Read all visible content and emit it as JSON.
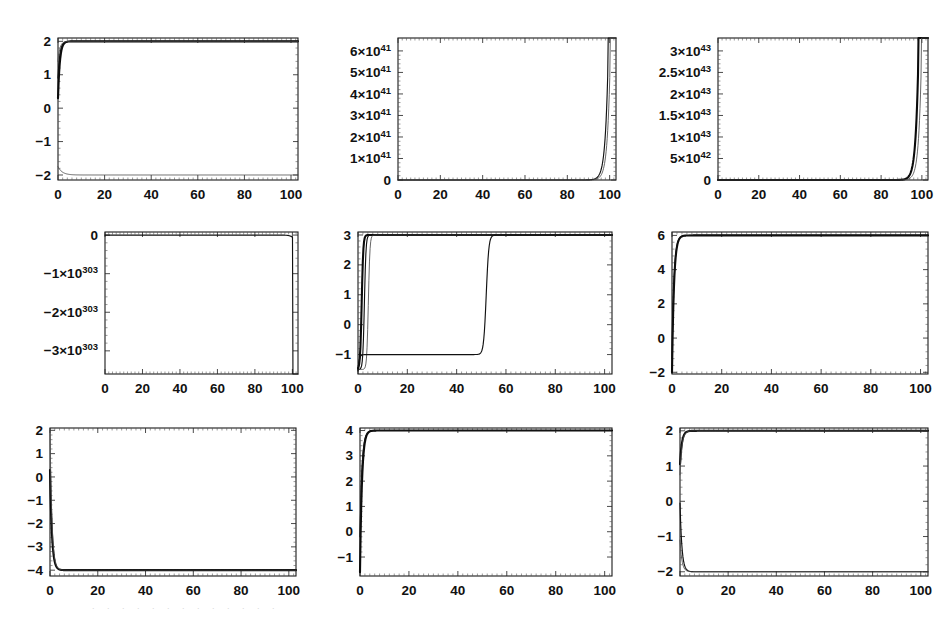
{
  "figure": {
    "title": "",
    "rows": 3,
    "columns": 3,
    "background_color": "#ffffff",
    "curve_color": "#111111",
    "frame_color": "#1a1a1a"
  },
  "chart_data": [
    {
      "id": "panel-1",
      "type": "line",
      "title": "",
      "xlabel": "",
      "ylabel": "",
      "xlim": [
        0,
        103
      ],
      "ylim": [
        -2.15,
        2.1
      ],
      "grid": false,
      "legend": null,
      "xticks": [
        0,
        20,
        40,
        60,
        80,
        100
      ],
      "xtick_labels": [
        "0",
        "20",
        "40",
        "60",
        "80",
        "100"
      ],
      "yticks": [
        -2,
        -1,
        0,
        1,
        2
      ],
      "ytick_labels": [
        "-2",
        "-1",
        "0",
        "1",
        "2"
      ],
      "series": [
        {
          "name": "upper-bundle",
          "asymptote": 2,
          "start": 0.3,
          "rise": "fast",
          "style": "thick"
        },
        {
          "name": "upper-bundle-2",
          "asymptote": 2,
          "start": 0.9,
          "rise": "fast",
          "style": "normal"
        },
        {
          "name": "upper-bundle-3",
          "asymptote": 2,
          "start": 1.4,
          "rise": "fast",
          "style": "light"
        },
        {
          "name": "lower-branch",
          "asymptote": -2,
          "start": -1.75,
          "rise": "slow",
          "style": "light"
        }
      ]
    },
    {
      "id": "panel-2",
      "type": "line",
      "title": "",
      "xlabel": "",
      "ylabel": "",
      "xlim": [
        0,
        103
      ],
      "ylim": [
        0,
        6.6
      ],
      "grid": false,
      "legend": null,
      "xticks": [
        0,
        20,
        40,
        60,
        80,
        100
      ],
      "xtick_labels": [
        "0",
        "20",
        "40",
        "60",
        "80",
        "100"
      ],
      "yticks": [
        0,
        1,
        2,
        3,
        4,
        5,
        6
      ],
      "ytick_labels": [
        "0",
        "1×10^41",
        "2×10^41",
        "3×10^41",
        "4×10^41",
        "5×10^41",
        "6×10^41"
      ],
      "ytick_mantissas": [
        "0",
        "1",
        "2",
        "3",
        "4",
        "5",
        "6"
      ],
      "ytick_exponents": [
        "",
        "41",
        "41",
        "41",
        "41",
        "41",
        "41"
      ],
      "series": [
        {
          "name": "blowup",
          "blowup_x": 99.5,
          "style": "normal"
        },
        {
          "name": "blowup-2",
          "blowup_x": 100.5,
          "style": "light"
        }
      ]
    },
    {
      "id": "panel-3",
      "type": "line",
      "title": "",
      "xlabel": "",
      "ylabel": "",
      "xlim": [
        0,
        103
      ],
      "ylim": [
        0,
        3.3
      ],
      "grid": false,
      "legend": null,
      "xticks": [
        0,
        20,
        40,
        60,
        80,
        100
      ],
      "xtick_labels": [
        "0",
        "20",
        "40",
        "60",
        "80",
        "100"
      ],
      "yticks": [
        0,
        0.5,
        1,
        1.5,
        2,
        2.5,
        3
      ],
      "ytick_labels": [
        "0",
        "5×10^42",
        "1×10^43",
        "1.5×10^43",
        "2×10^43",
        "2.5×10^43",
        "3×10^43"
      ],
      "ytick_mantissas": [
        "0",
        "5",
        "1",
        "1.5",
        "2",
        "2.5",
        "3"
      ],
      "ytick_exponents": [
        "",
        "42",
        "43",
        "43",
        "43",
        "43",
        "43"
      ],
      "series": [
        {
          "name": "blowup",
          "blowup_x": 98.5,
          "style": "thick"
        },
        {
          "name": "blowup-2",
          "blowup_x": 100.0,
          "style": "light"
        }
      ]
    },
    {
      "id": "panel-4",
      "type": "line",
      "title": "",
      "xlabel": "",
      "ylabel": "",
      "xlim": [
        0,
        103
      ],
      "ylim": [
        -3.6,
        0.08
      ],
      "grid": false,
      "legend": null,
      "xticks": [
        0,
        20,
        40,
        60,
        80,
        100
      ],
      "xtick_labels": [
        "0",
        "20",
        "40",
        "60",
        "80",
        "100"
      ],
      "yticks": [
        0,
        -1,
        -2,
        -3
      ],
      "ytick_labels": [
        "0",
        "-1×10^303",
        "-2×10^303",
        "-3×10^303"
      ],
      "ytick_mantissas": [
        "0",
        "−1",
        "−2",
        "−3"
      ],
      "ytick_exponents": [
        "",
        "303",
        "303",
        "303"
      ],
      "series": [
        {
          "name": "negative-blowup",
          "blowup_x": 100.5,
          "style": "normal"
        }
      ]
    },
    {
      "id": "panel-5",
      "type": "line",
      "title": "",
      "xlabel": "",
      "ylabel": "",
      "xlim": [
        0,
        103
      ],
      "ylim": [
        -1.65,
        3.1
      ],
      "grid": false,
      "legend": null,
      "xticks": [
        0,
        20,
        40,
        60,
        80,
        100
      ],
      "xtick_labels": [
        "0",
        "20",
        "40",
        "60",
        "80",
        "100"
      ],
      "yticks": [
        -1,
        0,
        1,
        2,
        3
      ],
      "ytick_labels": [
        "-1",
        "0",
        "1",
        "2",
        "3"
      ],
      "series": [
        {
          "name": "fast-rise-1",
          "asymptote": 3,
          "transition_x": 1.5,
          "style": "thick"
        },
        {
          "name": "fast-rise-2",
          "asymptote": 3,
          "transition_x": 2.6,
          "style": "normal"
        },
        {
          "name": "fast-rise-3",
          "asymptote": 3,
          "transition_x": 4.2,
          "style": "light"
        },
        {
          "name": "delayed-jump",
          "asymptote": 3,
          "plateau": -1,
          "transition_x": 52,
          "style": "normal"
        }
      ]
    },
    {
      "id": "panel-6",
      "type": "line",
      "title": "",
      "xlabel": "",
      "ylabel": "",
      "xlim": [
        0,
        103
      ],
      "ylim": [
        -2.1,
        6.2
      ],
      "grid": false,
      "legend": null,
      "xticks": [
        0,
        20,
        40,
        60,
        80,
        100
      ],
      "xtick_labels": [
        "0",
        "20",
        "40",
        "60",
        "80",
        "100"
      ],
      "yticks": [
        -2,
        0,
        2,
        4,
        6
      ],
      "ytick_labels": [
        "-2",
        "0",
        "2",
        "4",
        "6"
      ],
      "series": [
        {
          "name": "rise-to-6",
          "asymptote": 6,
          "start": -2.0,
          "style": "thick"
        },
        {
          "name": "rise-to-6-2",
          "asymptote": 6,
          "start": -1.2,
          "style": "normal"
        }
      ]
    },
    {
      "id": "panel-7",
      "type": "line",
      "title": "",
      "xlabel": "",
      "ylabel": "",
      "xlim": [
        0,
        103
      ],
      "ylim": [
        -4.25,
        2.1
      ],
      "grid": false,
      "legend": null,
      "xticks": [
        0,
        20,
        40,
        60,
        80,
        100
      ],
      "xtick_labels": [
        "0",
        "20",
        "40",
        "60",
        "80",
        "100"
      ],
      "yticks": [
        -4,
        -3,
        -2,
        -1,
        0,
        1,
        2
      ],
      "ytick_labels": [
        "-4",
        "-3",
        "-2",
        "-1",
        "0",
        "1",
        "2"
      ],
      "series": [
        {
          "name": "decay-to-minus4",
          "asymptote": -4,
          "start": 0.3,
          "style": "thick"
        },
        {
          "name": "decay-to-minus4-2",
          "asymptote": -4,
          "start": 2.0,
          "style": "light"
        }
      ]
    },
    {
      "id": "panel-8",
      "type": "line",
      "title": "",
      "xlabel": "",
      "ylabel": "",
      "xlim": [
        0,
        103
      ],
      "ylim": [
        -1.75,
        4.1
      ],
      "grid": false,
      "legend": null,
      "xticks": [
        0,
        20,
        40,
        60,
        80,
        100
      ],
      "xtick_labels": [
        "0",
        "20",
        "40",
        "60",
        "80",
        "100"
      ],
      "yticks": [
        -1,
        0,
        1,
        2,
        3,
        4
      ],
      "ytick_labels": [
        "-1",
        "0",
        "1",
        "2",
        "3",
        "4"
      ],
      "series": [
        {
          "name": "rise-to-4",
          "asymptote": 4,
          "start": -1.6,
          "style": "thick"
        },
        {
          "name": "rise-to-4-2",
          "asymptote": 4,
          "start": -0.2,
          "style": "normal"
        }
      ]
    },
    {
      "id": "panel-9",
      "type": "line",
      "title": "",
      "xlabel": "",
      "ylabel": "",
      "xlim": [
        0,
        103
      ],
      "ylim": [
        -2.12,
        2.08
      ],
      "grid": false,
      "legend": null,
      "xticks": [
        0,
        20,
        40,
        60,
        80,
        100
      ],
      "xtick_labels": [
        "0",
        "20",
        "40",
        "60",
        "80",
        "100"
      ],
      "yticks": [
        -2,
        -1,
        0,
        1,
        2
      ],
      "ytick_labels": [
        "-2",
        "-1",
        "0",
        "1",
        "2"
      ],
      "series": [
        {
          "name": "upper-branch",
          "asymptote": 2,
          "start": 1.05,
          "style": "thick"
        },
        {
          "name": "upper-branch-2",
          "asymptote": 2,
          "start": 0.75,
          "style": "light"
        },
        {
          "name": "lower-branch",
          "asymptote": -2,
          "start": -0.05,
          "style": "normal"
        },
        {
          "name": "lower-branch-2",
          "asymptote": -2,
          "start": -1.1,
          "style": "light"
        }
      ]
    }
  ],
  "scan_artifact": {
    "visible": true,
    "text": ". . . . . . . . . . . . ."
  }
}
